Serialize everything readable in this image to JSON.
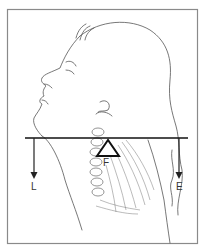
{
  "figure": {
    "labels": {
      "load": "L",
      "fulcrum": "F",
      "effort": "E"
    },
    "colors": {
      "frame": "#8a8a8a",
      "lever": "#111111",
      "sketch": "#555555"
    }
  }
}
